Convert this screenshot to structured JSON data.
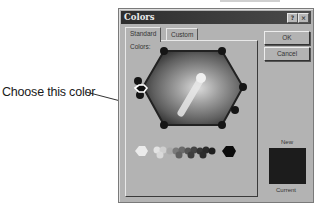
{
  "annotation": {
    "callout_text": "Choose this color"
  },
  "dialog": {
    "title": "Colors",
    "help_button": "?",
    "close_button": "×",
    "tabs": [
      {
        "label": "Standard",
        "active": true
      },
      {
        "label": "Custom",
        "active": false
      }
    ],
    "colors_label": "Colors:",
    "ok_label": "OK",
    "cancel_label": "Cancel",
    "new_label": "New",
    "current_label": "Current",
    "new_color": "#1c1c1c",
    "current_color": "#1c1c1c",
    "grayscale": [
      "#ececec",
      "#dcdcdc",
      "#c8c8c8",
      "#b0b0b0",
      "#9a9a9a",
      "#858585",
      "#707070",
      "#5c5c5c",
      "#4a4a4a",
      "#383838",
      "#2a2a2a",
      "#1a1a1a",
      "#0c0c0c"
    ]
  }
}
